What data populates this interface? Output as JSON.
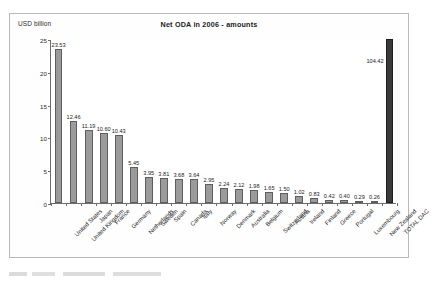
{
  "chart_data": {
    "type": "bar",
    "title": "Net ODA in 2006 - amounts",
    "xlabel": "",
    "ylabel": "USD billion",
    "ylim": [
      0,
      25
    ],
    "yticks": [
      0,
      5,
      10,
      15,
      20,
      25
    ],
    "grid": false,
    "legend": null,
    "note": "TOTAL DAC bar value 104.42 exceeds the axis maximum and is drawn clipped at the top of the plot.",
    "categories": [
      "United States",
      "United Kingdom",
      "Japan",
      "France",
      "Germany",
      "Netherlands",
      "Sweden",
      "Spain",
      "Canada",
      "Italy",
      "Norway",
      "Denmark",
      "Australia",
      "Belgium",
      "Switzerland",
      "Austria",
      "Ireland",
      "Finland",
      "Greece",
      "Portugal",
      "Luxembourg",
      "New Zealand",
      "TOTAL DAC"
    ],
    "values": [
      23.53,
      12.46,
      11.19,
      10.6,
      10.43,
      5.45,
      3.95,
      3.81,
      3.68,
      3.64,
      2.95,
      2.24,
      2.12,
      1.98,
      1.65,
      1.5,
      1.02,
      0.83,
      0.42,
      0.4,
      0.29,
      0.26,
      104.42
    ],
    "value_labels": [
      "23.53",
      "12.46",
      "11.19",
      "10.60",
      "10.43",
      "5.45",
      "3.95",
      "3.81",
      "3.68",
      "3.64",
      "2.95",
      "2.24",
      "2.12",
      "1.98",
      "1.65",
      "1.50",
      "1.02",
      "0.83",
      "0.42",
      "0.40",
      "0.29",
      "0.26",
      "104.42"
    ],
    "tick_labels": [
      "25",
      "20",
      "15",
      "10",
      "5",
      "0"
    ],
    "colors": {
      "bar": "#9b9b9b",
      "bar_edge": "#5e5e5e",
      "total_bar": "#3a3a3a",
      "axis": "#6d6d6d",
      "text": "#1d1d1d",
      "frame": "#b9b9b9",
      "background": "#ffffff"
    }
  }
}
